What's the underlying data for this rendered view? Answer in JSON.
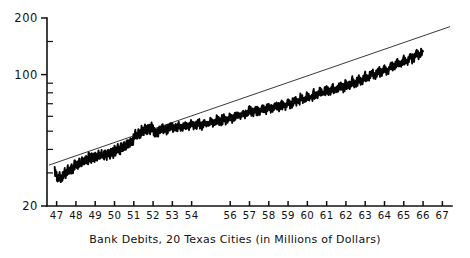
{
  "caption": "Bank Debits, 20 Texas Cities (in Millions of Dollars)",
  "colors": {
    "series": "#050505",
    "trend": "#222222",
    "axis": "#111111",
    "background": "#ffffff"
  },
  "chart_data": {
    "type": "line",
    "title": "",
    "subtitle": "",
    "xlabel": "Bank Debits, 20 Texas Cities (in Millions of Dollars)",
    "ylabel": "",
    "yscale": "log",
    "xscale": "linear",
    "grid": false,
    "legend": null,
    "xlim": [
      1946.5,
      1967.5
    ],
    "ylim": [
      20,
      200
    ],
    "ytick_labels": [
      "200",
      "100",
      "20"
    ],
    "ytick_values": [
      200,
      100,
      20
    ],
    "yminor_ticks": [
      30,
      40,
      50,
      60,
      70,
      80,
      90,
      150
    ],
    "xtick_labels": [
      "47",
      "48",
      "49",
      "50",
      "51",
      "52",
      "53",
      "54",
      "56",
      "57",
      "58",
      "59",
      "60",
      "61",
      "62",
      "63",
      "64",
      "65",
      "66",
      "67"
    ],
    "xtick_values": [
      1947,
      1948,
      1949,
      1950,
      1951,
      1952,
      1953,
      1954,
      1956,
      1957,
      1958,
      1959,
      1960,
      1961,
      1962,
      1963,
      1964,
      1965,
      1966,
      1967
    ],
    "series": [
      {
        "name": "Bank Debits (monthly)",
        "style": "noisy-line",
        "x": [
          1946.9,
          1947.0,
          1947.08,
          1947.17,
          1947.25,
          1947.33,
          1947.42,
          1947.5,
          1947.58,
          1947.67,
          1947.75,
          1947.83,
          1947.92,
          1948.0,
          1948.08,
          1948.17,
          1948.25,
          1948.33,
          1948.42,
          1948.5,
          1948.58,
          1948.67,
          1948.75,
          1948.83,
          1948.92,
          1949.0,
          1949.08,
          1949.17,
          1949.25,
          1949.33,
          1949.42,
          1949.5,
          1949.58,
          1949.67,
          1949.75,
          1949.83,
          1949.92,
          1950.0,
          1950.08,
          1950.17,
          1950.25,
          1950.33,
          1950.42,
          1950.5,
          1950.58,
          1950.67,
          1950.75,
          1950.83,
          1950.92,
          1951.0,
          1951.08,
          1951.17,
          1951.25,
          1951.33,
          1951.42,
          1951.5,
          1951.58,
          1951.67,
          1951.75,
          1951.83,
          1951.92,
          1952.0,
          1952.17,
          1952.33,
          1952.5,
          1952.67,
          1952.83,
          1953.0,
          1953.17,
          1953.33,
          1953.5,
          1953.67,
          1953.83,
          1954.0,
          1954.17,
          1954.33,
          1954.5,
          1954.67,
          1954.83,
          1955.0,
          1955.17,
          1955.33,
          1955.5,
          1955.67,
          1955.83,
          1956.0,
          1956.17,
          1956.33,
          1956.5,
          1956.67,
          1956.83,
          1957.0,
          1957.17,
          1957.33,
          1957.5,
          1957.67,
          1957.83,
          1958.0,
          1958.17,
          1958.33,
          1958.5,
          1958.67,
          1958.83,
          1959.0,
          1959.17,
          1959.33,
          1959.5,
          1959.67,
          1959.83,
          1960.0,
          1960.17,
          1960.33,
          1960.5,
          1960.67,
          1960.83,
          1961.0,
          1961.17,
          1961.33,
          1961.5,
          1961.67,
          1961.83,
          1962.0,
          1962.17,
          1962.33,
          1962.5,
          1962.67,
          1962.83,
          1963.0,
          1963.17,
          1963.33,
          1963.5,
          1963.67,
          1963.83,
          1964.0,
          1964.17,
          1964.33,
          1964.5,
          1964.67,
          1964.83,
          1965.0,
          1965.17,
          1965.33,
          1965.5,
          1965.67,
          1965.83,
          1966.0
        ],
        "y": [
          30.5,
          29.0,
          27.8,
          28.6,
          27.6,
          28.9,
          30.2,
          29.4,
          31.0,
          30.2,
          31.8,
          31.0,
          32.6,
          33.4,
          32.4,
          34.2,
          33.2,
          34.8,
          34.0,
          35.6,
          34.6,
          36.2,
          35.2,
          36.8,
          35.8,
          37.0,
          35.8,
          37.4,
          36.2,
          37.8,
          36.4,
          38.2,
          37.0,
          38.6,
          37.4,
          39.0,
          38.0,
          39.6,
          38.4,
          40.4,
          39.2,
          41.2,
          40.0,
          42.2,
          41.0,
          43.4,
          42.0,
          44.6,
          43.2,
          46.0,
          48.5,
          47.0,
          49.5,
          48.0,
          50.5,
          49.0,
          51.5,
          50.0,
          52.0,
          50.5,
          52.5,
          51.0,
          49.0,
          50.5,
          52.0,
          50.0,
          51.5,
          53.0,
          51.5,
          53.5,
          52.0,
          54.0,
          52.5,
          54.5,
          53.0,
          55.0,
          53.5,
          55.5,
          54.0,
          56.5,
          55.0,
          57.5,
          56.0,
          58.5,
          57.0,
          59.5,
          58.0,
          61.0,
          59.5,
          62.5,
          61.0,
          64.0,
          62.0,
          65.0,
          63.0,
          66.0,
          64.5,
          67.0,
          65.0,
          68.0,
          66.0,
          69.0,
          67.5,
          71.0,
          69.0,
          73.0,
          71.0,
          75.0,
          73.0,
          77.0,
          75.0,
          79.0,
          77.0,
          81.0,
          79.0,
          83.0,
          80.0,
          85.0,
          82.0,
          87.0,
          84.0,
          89.0,
          86.0,
          92.0,
          89.0,
          95.0,
          92.0,
          98.0,
          95.0,
          101.0,
          98.0,
          105.0,
          101.0,
          108.0,
          104.0,
          112.0,
          108.0,
          116.0,
          112.0,
          120.0,
          116.0,
          125.0,
          121.0,
          130.0,
          126.0,
          133.0
        ]
      }
    ],
    "trend": {
      "name": "Fitted exponential trend",
      "style": "straight-line-on-log",
      "x": [
        1946.6,
        1967.4
      ],
      "y": [
        33.0,
        180.0
      ]
    },
    "annotations": []
  }
}
